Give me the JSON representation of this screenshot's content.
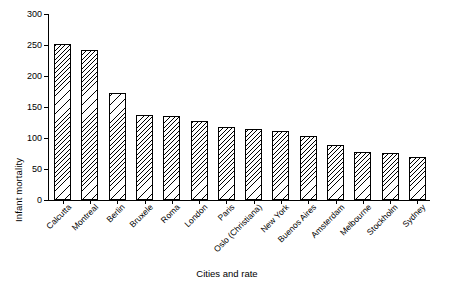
{
  "chart_data": {
    "type": "bar",
    "title": "",
    "xlabel": "Cities and rate",
    "ylabel": "Infant mortality",
    "ylim": [
      0,
      300
    ],
    "yticks": [
      0,
      50,
      100,
      150,
      200,
      250,
      300
    ],
    "grid": false,
    "legend": "none",
    "categories": [
      "Calcutta",
      "Montreal",
      "Berlin",
      "Bruxele",
      "Roma",
      "London",
      "Paris",
      "Oslo (Christiana)",
      "New York",
      "Buenos Aires",
      "Amsterdam",
      "Melbourne",
      "Stockholm",
      "Sydney"
    ],
    "values": [
      252,
      242,
      173,
      137,
      136,
      128,
      117,
      115,
      111,
      104,
      89,
      78,
      76,
      70
    ]
  }
}
